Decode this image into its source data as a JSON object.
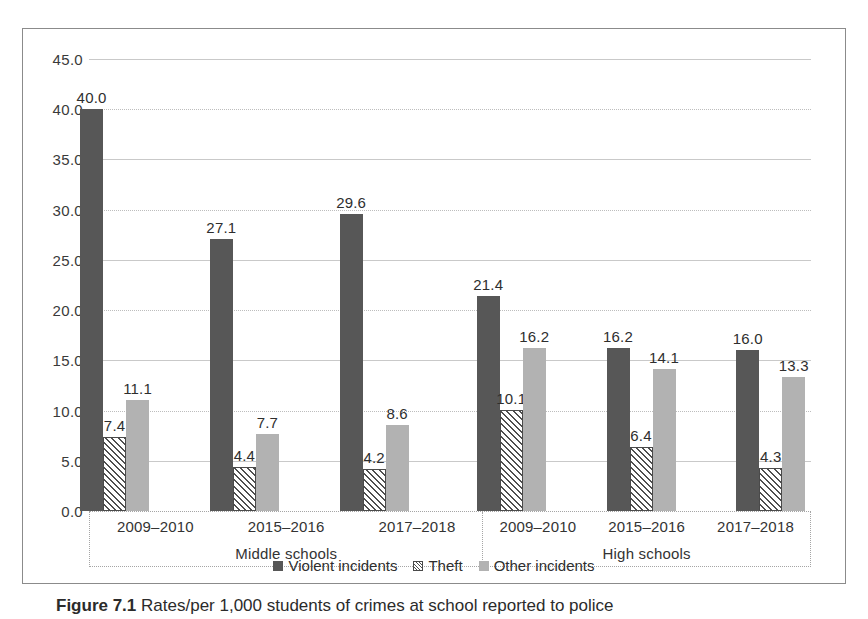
{
  "figure": {
    "number_label": "Figure 7.1",
    "caption_text": "Rates/per 1,000 students of crimes at school reported to police"
  },
  "chart_data": {
    "type": "bar",
    "title": "",
    "xlabel": "",
    "ylabel": "",
    "ylim": [
      0,
      45
    ],
    "ytick_step": 5,
    "grid": true,
    "legend_position": "bottom",
    "categories": [
      "2009–2010",
      "2015–2016",
      "2017–2018"
    ],
    "groups": [
      "Middle schools",
      "High schools"
    ],
    "ytick_labels": [
      "0.0",
      "5.0",
      "10.0",
      "15.0",
      "20.0",
      "25.0",
      "30.0",
      "35.0",
      "40.0",
      "45.0"
    ],
    "series": [
      {
        "name": "Violent incidents",
        "color": "#575757",
        "pattern": "solid",
        "values_by_group": {
          "Middle schools": [
            40.0,
            27.1,
            29.6
          ],
          "High schools": [
            21.4,
            16.2,
            16.0
          ]
        }
      },
      {
        "name": "Theft",
        "color": "#ffffff",
        "pattern": "diagonal-hatch",
        "values_by_group": {
          "Middle schools": [
            7.4,
            4.4,
            4.2
          ],
          "High schools": [
            10.1,
            6.4,
            4.3
          ]
        }
      },
      {
        "name": "Other incidents",
        "color": "#b2b2b2",
        "pattern": "solid",
        "values_by_group": {
          "Middle schools": [
            11.1,
            7.7,
            8.6
          ],
          "High schools": [
            16.2,
            14.1,
            13.3
          ]
        }
      }
    ],
    "data_labels": {
      "Middle schools": {
        "2009–2010": {
          "Violent incidents": "40.0",
          "Theft": "7.4",
          "Other incidents": "11.1"
        },
        "2015–2016": {
          "Violent incidents": "27.1",
          "Theft": "4.4",
          "Other incidents": "7.7"
        },
        "2017–2018": {
          "Violent incidents": "29.6",
          "Theft": "4.2",
          "Other incidents": "8.6"
        }
      },
      "High schools": {
        "2009–2010": {
          "Violent incidents": "21.4",
          "Theft": "10.1",
          "Other incidents": "16.2"
        },
        "2015–2016": {
          "Violent incidents": "16.2",
          "Theft": "6.4",
          "Other incidents": "14.1"
        },
        "2017–2018": {
          "Violent incidents": "16.0",
          "Theft": "4.3",
          "Other incidents": "13.3"
        }
      }
    }
  },
  "legend": {
    "items": [
      {
        "label": "Violent incidents",
        "key": "violent"
      },
      {
        "label": "Theft",
        "key": "theft"
      },
      {
        "label": "Other incidents",
        "key": "other"
      }
    ]
  }
}
